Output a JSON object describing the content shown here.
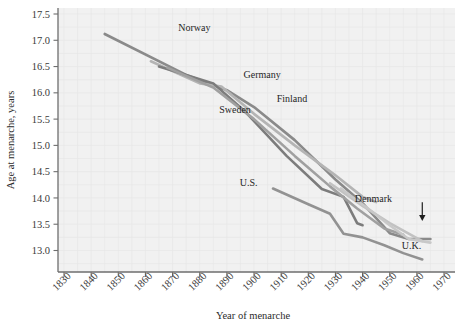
{
  "chart_data": {
    "type": "line",
    "title": "",
    "xlabel": "Year of menarche",
    "ylabel": "Age at menarche, years",
    "xlim": [
      1830,
      1970
    ],
    "ylim": [
      12.75,
      17.6
    ],
    "xticks": [
      1830,
      1840,
      1850,
      1860,
      1870,
      1880,
      1890,
      1900,
      1910,
      1920,
      1930,
      1940,
      1950,
      1960,
      1970
    ],
    "yticks": [
      13.0,
      13.5,
      14.0,
      14.5,
      15.0,
      15.5,
      16.0,
      16.5,
      17.0,
      17.5
    ],
    "ytick_labels": [
      "13.0",
      "13.5",
      "14.0",
      "14.5",
      "15.0",
      "15.5",
      "16.0",
      "16.5",
      "17.0",
      "17.5"
    ],
    "xtick_labels": [
      "1830",
      "1840",
      "1850",
      "1860",
      "1870",
      "1880",
      "1890",
      "1900",
      "1910",
      "1920",
      "1930",
      "1940",
      "1950",
      "1960",
      "1970"
    ],
    "grid": true,
    "legend_position": "inline-labels",
    "plot_background": "#f1f1f1",
    "series": [
      {
        "name": "Norway",
        "color": "#8a8a8a",
        "label_x": 1878,
        "label_y": 17.18,
        "x": [
          1845,
          1875,
          1890,
          1900,
          1915,
          1930,
          1940,
          1950,
          1957,
          1965
        ],
        "y": [
          17.12,
          16.34,
          16.05,
          15.73,
          15.1,
          14.35,
          13.9,
          13.33,
          13.22,
          13.22
        ]
      },
      {
        "name": "Sweden",
        "color": "#b4b4b4",
        "label_x": 1893,
        "label_y": 15.62,
        "x": [
          1862,
          1880,
          1888,
          1900,
          1915,
          1930,
          1940,
          1945
        ],
        "y": [
          16.6,
          16.18,
          16.12,
          15.6,
          15.0,
          14.43,
          14.02,
          13.92
        ]
      },
      {
        "name": "Germany",
        "color": "#7c7c7c",
        "label_x": 1903,
        "label_y": 16.28,
        "x": [
          1865,
          1885,
          1897,
          1912,
          1925,
          1933,
          1938,
          1940
        ],
        "y": [
          16.5,
          16.18,
          15.63,
          14.8,
          14.17,
          14.02,
          13.52,
          13.48
        ]
      },
      {
        "name": "Finland",
        "color": "#a0a0a0",
        "label_x": 1914,
        "label_y": 15.82,
        "x": [
          1868,
          1885,
          1900,
          1915,
          1928,
          1938,
          1948,
          1955
        ],
        "y": [
          16.48,
          16.1,
          15.5,
          14.8,
          14.22,
          13.8,
          13.42,
          13.3
        ]
      },
      {
        "name": "U.S.",
        "color": "#929292",
        "label_x": 1898,
        "label_y": 14.22,
        "x": [
          1907,
          1920,
          1928,
          1933,
          1940,
          1948,
          1955,
          1962
        ],
        "y": [
          14.18,
          13.88,
          13.7,
          13.32,
          13.25,
          13.1,
          12.95,
          12.83
        ]
      },
      {
        "name": "Denmark",
        "color": "#c2c2c2",
        "label_x": 1944,
        "label_y": 13.92,
        "x": [
          1928,
          1940,
          1950,
          1957,
          1962
        ],
        "y": [
          14.28,
          13.85,
          13.52,
          13.32,
          13.18
        ]
      },
      {
        "name": "U.K.",
        "color": "#c8c8c8",
        "label_x": 1958,
        "label_y": 13.02,
        "x": [
          1932,
          1942,
          1950,
          1957,
          1965
        ],
        "y": [
          14.18,
          13.8,
          13.48,
          13.22,
          13.15
        ]
      }
    ],
    "annotations": [
      {
        "name": "denmark-arrow",
        "text": "",
        "points_to_x": 1962,
        "points_to_y": 13.56,
        "from_x": 1962,
        "from_y": 13.92
      }
    ]
  },
  "axis": {
    "x_title": "Year of menarche",
    "y_title": "Age at menarche, years"
  }
}
